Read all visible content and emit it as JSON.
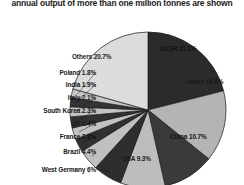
{
  "chart_data": {
    "type": "pie",
    "title": "annual output of more than one million tonnes are shown",
    "xlabel": "",
    "ylabel": "",
    "legend": "none",
    "grid": false,
    "unit": "%",
    "categories": [
      "USSR",
      "Japan",
      "China",
      "USA",
      "West Germany",
      "Brazil",
      "France",
      "UK",
      "South Korea",
      "Italy",
      "India",
      "Poland",
      "Others"
    ],
    "values": [
      21.1,
      14.8,
      10.7,
      9.3,
      6.0,
      4.4,
      2.8,
      2.4,
      2.3,
      2.1,
      1.9,
      1.8,
      20.7
    ],
    "slices": [
      {
        "label": "USSR 21.1%",
        "name": "USSR",
        "value": 21.1,
        "fill": "#2b2b2b",
        "label_side": "inside",
        "lx": 160,
        "ly": 45
      },
      {
        "label": "Japan 14.8%",
        "name": "Japan",
        "value": 14.8,
        "fill": "#b4b4b4",
        "label_side": "inside",
        "lx": 186,
        "ly": 78
      },
      {
        "label": "China 10.7%",
        "name": "China",
        "value": 10.7,
        "fill": "#3a3a3a",
        "label_side": "inside",
        "lx": 170,
        "ly": 133
      },
      {
        "label": "USA 9.3%",
        "name": "USA",
        "value": 9.3,
        "fill": "#bdbdbd",
        "label_side": "inside",
        "lx": 122,
        "ly": 155
      },
      {
        "label": "West Germany 6%",
        "name": "West Germany",
        "value": 6.0,
        "fill": "#2e2e2e",
        "label_side": "left",
        "lx": 0,
        "ly": 166
      },
      {
        "label": "Brazil 4.4%",
        "name": "Brazil",
        "value": 4.4,
        "fill": "#c0c0c0",
        "label_side": "left",
        "lx": 0,
        "ly": 148
      },
      {
        "label": "France 2.8%",
        "name": "France",
        "value": 2.8,
        "fill": "#303030",
        "label_side": "left",
        "lx": 0,
        "ly": 133
      },
      {
        "label": "UK 2.4%",
        "name": "UK",
        "value": 2.4,
        "fill": "#c2c2c2",
        "label_side": "left",
        "lx": 0,
        "ly": 120
      },
      {
        "label": "South Korea 2.3%",
        "name": "South Korea",
        "value": 2.3,
        "fill": "#323232",
        "label_side": "left",
        "lx": 0,
        "ly": 107
      },
      {
        "label": "Italy 2.1%",
        "name": "Italy",
        "value": 2.1,
        "fill": "#c4c4c4",
        "label_side": "left",
        "lx": 0,
        "ly": 94
      },
      {
        "label": "India 1.9%",
        "name": "India",
        "value": 1.9,
        "fill": "#343434",
        "label_side": "left",
        "lx": 0,
        "ly": 81
      },
      {
        "label": "Poland 1.8%",
        "name": "Poland",
        "value": 1.8,
        "fill": "#c6c6c6",
        "label_side": "left",
        "lx": 0,
        "ly": 69
      },
      {
        "label": "Others 20.7%",
        "name": "Others",
        "value": 20.7,
        "fill": "#dcdcdc",
        "label_side": "inside",
        "lx": 72,
        "ly": 53
      }
    ],
    "geometry": {
      "cx": 148,
      "cy": 110,
      "r": 78,
      "start_angle_deg": -90,
      "direction": "clockwise"
    },
    "colors": {
      "dark": "#2b2b2b",
      "light": "#c6c6c6",
      "others": "#dcdcdc",
      "outline": "#1a1a1a",
      "background": "#ffffff",
      "text": "#111111"
    }
  }
}
